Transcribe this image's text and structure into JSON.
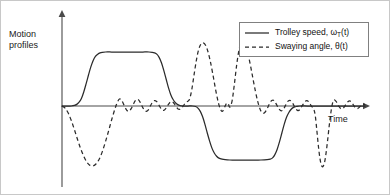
{
  "figure": {
    "ylabel_line1": "Motion",
    "ylabel_line2": "profiles",
    "xlabel": "Time"
  },
  "legend": {
    "position": "top-right",
    "items": [
      {
        "style": "solid",
        "text_before": "Trolley speed, ω",
        "subscript": "T",
        "text_after": "(t)"
      },
      {
        "style": "dashed",
        "text_before": "Swaying angle, θ(t)",
        "subscript": "",
        "text_after": ""
      }
    ]
  },
  "chart_data": {
    "type": "line",
    "title": "",
    "xlabel": "Time",
    "ylabel": "Motion profiles",
    "grid": false,
    "legend_position": "top-right",
    "axis_style": "arrow-axes-no-ticks",
    "xlim": [
      0,
      100
    ],
    "ylim": [
      -1.35,
      1.35
    ],
    "annotations": [
      "Trolley speed ramps up to a positive plateau, returns to zero, then ramps down to a negative plateau of similar magnitude before returning to zero.",
      "Swaying angle shows a large negative swing during acceleration, small residual oscillation during constant speed, a large positive swing during deceleration, then repeats with opposite sign for the reverse motion."
    ],
    "series": [
      {
        "name": "Trolley speed, ω_T(t)",
        "style": "solid",
        "points": [
          [
            0.0,
            0.0
          ],
          [
            3.0,
            0.0
          ],
          [
            6.0,
            0.0
          ],
          [
            8.0,
            0.01
          ],
          [
            9.5,
            0.03
          ],
          [
            11.0,
            0.07
          ],
          [
            12.5,
            0.14
          ],
          [
            14.0,
            0.26
          ],
          [
            15.5,
            0.41
          ],
          [
            17.0,
            0.57
          ],
          [
            18.5,
            0.72
          ],
          [
            20.0,
            0.84
          ],
          [
            21.5,
            0.92
          ],
          [
            23.0,
            0.96
          ],
          [
            24.5,
            0.985
          ],
          [
            26.0,
            0.995
          ],
          [
            28.0,
            1.0
          ],
          [
            32.0,
            1.0
          ],
          [
            36.0,
            1.0
          ],
          [
            40.0,
            1.0
          ],
          [
            44.0,
            1.0
          ],
          [
            48.0,
            1.0
          ],
          [
            52.0,
            1.0
          ],
          [
            56.0,
            1.0
          ],
          [
            58.0,
            0.995
          ],
          [
            59.5,
            0.985
          ],
          [
            61.0,
            0.96
          ],
          [
            62.5,
            0.9
          ],
          [
            64.0,
            0.8
          ],
          [
            65.5,
            0.66
          ],
          [
            67.0,
            0.5
          ],
          [
            68.5,
            0.34
          ],
          [
            70.0,
            0.21
          ],
          [
            71.5,
            0.12
          ],
          [
            73.0,
            0.06
          ],
          [
            74.5,
            0.025
          ],
          [
            76.0,
            0.008
          ],
          [
            78.0,
            0.0
          ],
          [
            81.0,
            0.0
          ],
          [
            84.0,
            0.0
          ],
          [
            86.0,
            -0.01
          ],
          [
            87.5,
            -0.04
          ],
          [
            89.0,
            -0.1
          ],
          [
            90.5,
            -0.2
          ],
          [
            92.0,
            -0.34
          ],
          [
            93.5,
            -0.5
          ],
          [
            95.0,
            -0.65
          ],
          [
            96.5,
            -0.78
          ],
          [
            98.0,
            -0.87
          ],
          [
            99.5,
            -0.93
          ],
          [
            101.0,
            -0.965
          ],
          [
            103.0,
            -0.985
          ],
          [
            105.0,
            -0.995
          ],
          [
            108.0,
            -1.0
          ],
          [
            113.0,
            -1.0
          ],
          [
            118.0,
            -1.0
          ],
          [
            123.0,
            -1.0
          ],
          [
            128.0,
            -1.0
          ],
          [
            132.0,
            -0.995
          ],
          [
            134.0,
            -0.985
          ],
          [
            135.5,
            -0.96
          ],
          [
            137.0,
            -0.9
          ],
          [
            138.5,
            -0.8
          ],
          [
            140.0,
            -0.66
          ],
          [
            141.5,
            -0.5
          ],
          [
            143.0,
            -0.34
          ],
          [
            144.5,
            -0.21
          ],
          [
            146.0,
            -0.12
          ],
          [
            147.5,
            -0.06
          ],
          [
            149.0,
            -0.025
          ],
          [
            151.0,
            -0.008
          ],
          [
            153.0,
            0.0
          ],
          [
            158.0,
            0.0
          ],
          [
            165.0,
            0.0
          ],
          [
            175.0,
            0.0
          ],
          [
            185.0,
            0.0
          ],
          [
            195.0,
            0.0
          ]
        ]
      },
      {
        "name": "Swaying angle, θ(t)",
        "style": "dashed",
        "points": [
          [
            0.0,
            0.0
          ],
          [
            2.0,
            -0.04
          ],
          [
            4.0,
            -0.13
          ],
          [
            6.0,
            -0.27
          ],
          [
            8.0,
            -0.44
          ],
          [
            10.0,
            -0.62
          ],
          [
            12.0,
            -0.79
          ],
          [
            14.0,
            -0.93
          ],
          [
            16.0,
            -1.04
          ],
          [
            18.0,
            -1.1
          ],
          [
            20.0,
            -1.11
          ],
          [
            22.0,
            -1.07
          ],
          [
            24.0,
            -0.98
          ],
          [
            26.0,
            -0.84
          ],
          [
            28.0,
            -0.66
          ],
          [
            30.0,
            -0.46
          ],
          [
            32.0,
            -0.25
          ],
          [
            34.0,
            -0.06
          ],
          [
            35.5,
            0.06
          ],
          [
            37.0,
            0.13
          ],
          [
            38.5,
            0.1
          ],
          [
            40.0,
            0.01
          ],
          [
            41.5,
            -0.07
          ],
          [
            43.0,
            -0.1
          ],
          [
            44.5,
            -0.05
          ],
          [
            46.0,
            0.04
          ],
          [
            47.5,
            0.11
          ],
          [
            49.0,
            0.12
          ],
          [
            50.5,
            0.06
          ],
          [
            52.0,
            -0.03
          ],
          [
            53.5,
            -0.09
          ],
          [
            55.0,
            -0.09
          ],
          [
            56.5,
            -0.02
          ],
          [
            58.0,
            0.06
          ],
          [
            59.5,
            0.1
          ],
          [
            61.0,
            0.08
          ],
          [
            62.5,
            0.01
          ],
          [
            64.0,
            -0.06
          ],
          [
            65.5,
            -0.08
          ],
          [
            67.0,
            -0.04
          ],
          [
            68.5,
            0.03
          ],
          [
            70.0,
            0.08
          ],
          [
            71.5,
            0.07
          ],
          [
            73.0,
            0.01
          ],
          [
            74.5,
            -0.05
          ],
          [
            76.0,
            -0.06
          ],
          [
            77.5,
            -0.02
          ],
          [
            79.0,
            0.04
          ],
          [
            80.5,
            0.08
          ],
          [
            82.0,
            0.12
          ],
          [
            83.5,
            0.3
          ],
          [
            85.0,
            0.58
          ],
          [
            86.5,
            0.85
          ],
          [
            88.0,
            1.05
          ],
          [
            89.5,
            1.15
          ],
          [
            91.0,
            1.17
          ],
          [
            92.5,
            1.12
          ],
          [
            94.0,
            1.0
          ],
          [
            95.5,
            0.82
          ],
          [
            97.0,
            0.6
          ],
          [
            98.5,
            0.36
          ],
          [
            100.0,
            0.14
          ],
          [
            101.0,
            0.02
          ],
          [
            102.0,
            -0.06
          ],
          [
            103.0,
            -0.1
          ],
          [
            104.0,
            -0.07
          ],
          [
            105.0,
            0.0
          ],
          [
            106.0,
            0.05
          ],
          [
            107.0,
            0.04
          ],
          [
            108.0,
            -0.02
          ],
          [
            109.5,
            0.1
          ],
          [
            111.0,
            0.42
          ],
          [
            112.5,
            0.78
          ],
          [
            114.0,
            1.05
          ],
          [
            115.5,
            1.18
          ],
          [
            117.0,
            1.19
          ],
          [
            118.5,
            1.1
          ],
          [
            120.0,
            0.93
          ],
          [
            121.5,
            0.72
          ],
          [
            123.0,
            0.49
          ],
          [
            124.5,
            0.27
          ],
          [
            126.0,
            0.08
          ],
          [
            127.5,
            -0.06
          ],
          [
            129.0,
            -0.13
          ],
          [
            130.5,
            -0.12
          ],
          [
            132.0,
            -0.05
          ],
          [
            133.5,
            0.04
          ],
          [
            135.0,
            0.1
          ],
          [
            136.5,
            0.1
          ],
          [
            138.0,
            0.03
          ],
          [
            139.5,
            -0.05
          ],
          [
            141.0,
            -0.09
          ],
          [
            142.5,
            -0.06
          ],
          [
            144.0,
            0.02
          ],
          [
            145.5,
            0.09
          ],
          [
            147.0,
            0.1
          ],
          [
            148.5,
            0.05
          ],
          [
            150.0,
            -0.03
          ],
          [
            151.5,
            -0.08
          ],
          [
            153.0,
            -0.07
          ],
          [
            154.5,
            0.0
          ],
          [
            156.0,
            0.07
          ],
          [
            157.5,
            0.1
          ],
          [
            159.0,
            0.07
          ],
          [
            160.5,
            0.0
          ],
          [
            162.0,
            -0.06
          ],
          [
            163.0,
            -0.18
          ],
          [
            164.0,
            -0.45
          ],
          [
            165.0,
            -0.74
          ],
          [
            166.0,
            -0.97
          ],
          [
            167.0,
            -1.1
          ],
          [
            168.0,
            -1.12
          ],
          [
            169.0,
            -1.04
          ],
          [
            170.0,
            -0.86
          ],
          [
            171.0,
            -0.62
          ],
          [
            172.0,
            -0.36
          ],
          [
            173.0,
            -0.13
          ],
          [
            174.0,
            0.04
          ],
          [
            175.0,
            0.11
          ],
          [
            176.5,
            0.08
          ],
          [
            178.0,
            0.0
          ],
          [
            179.5,
            -0.05
          ],
          [
            181.0,
            -0.04
          ],
          [
            182.5,
            0.02
          ],
          [
            184.0,
            0.08
          ],
          [
            185.5,
            0.09
          ],
          [
            187.0,
            0.04
          ],
          [
            188.5,
            -0.02
          ],
          [
            190.0,
            -0.05
          ],
          [
            191.5,
            -0.02
          ],
          [
            193.0,
            0.02
          ],
          [
            195.0,
            0.03
          ]
        ]
      }
    ]
  }
}
